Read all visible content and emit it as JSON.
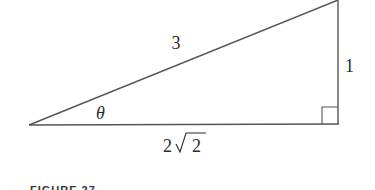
{
  "diagram": {
    "type": "right-triangle",
    "labels": {
      "hypotenuse": "3",
      "opposite": "1",
      "adjacent_coef": "2",
      "adjacent_radicand": "2",
      "angle": "θ"
    },
    "caption": "FIGURE 27",
    "colors": {
      "stroke": "#555555",
      "text": "#2b2b2b"
    }
  }
}
